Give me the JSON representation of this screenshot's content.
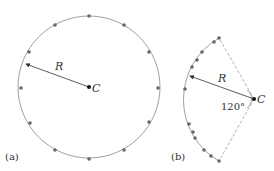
{
  "panel_a": {
    "label": "(a)",
    "radius_label": "R",
    "center_label": "C",
    "dot_count": 14,
    "colors": {
      "circle": "#888888",
      "dot": "#666666",
      "arrow": "#333333",
      "center": "#111111"
    }
  },
  "panel_b": {
    "label": "(b)",
    "radius_label": "R",
    "center_label": "C",
    "angle_label": "120°",
    "dot_count": 13,
    "colors": {
      "arc": "#888888",
      "dashed": "#999999",
      "dot": "#666666",
      "arrow": "#333333",
      "center": "#111111"
    }
  }
}
